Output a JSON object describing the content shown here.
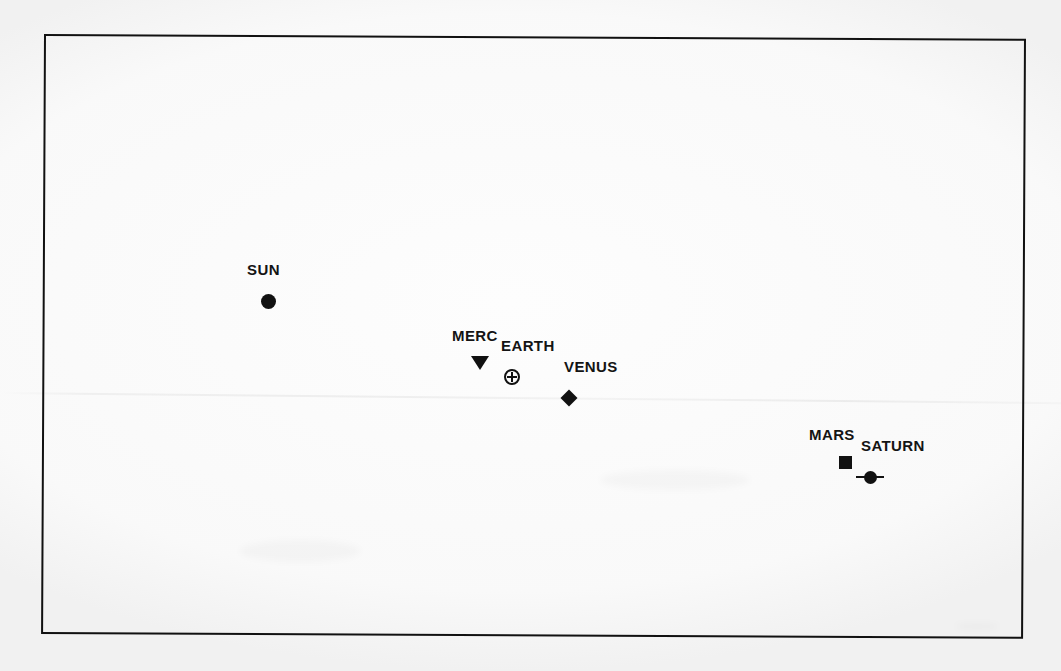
{
  "figure": {
    "type": "scatter",
    "background_color": "#fdfdfd",
    "ink_color": "#111111",
    "frame": {
      "name": "plot-border",
      "x": 44,
      "y": 34,
      "width": 982,
      "height": 600,
      "border_width": 2,
      "border_color": "#111111"
    }
  },
  "chart_data": {
    "type": "scatter",
    "title": "",
    "subtitle": "",
    "xlabel": "",
    "ylabel": "",
    "grid": false,
    "axis_ticks": false,
    "legend": "none",
    "xlim": [
      44,
      1026
    ],
    "ylim": [
      34,
      634
    ],
    "note": "Marker positions are given in page pixel coordinates; axes are unlabeled in the source figure.",
    "points": [
      {
        "label": "SUN",
        "marker": "filled-circle",
        "marker_size": 15,
        "x": 268,
        "y": 301,
        "label_x": 247,
        "label_y": 262
      },
      {
        "label": "MERC",
        "marker": "filled-triangle-down",
        "marker_size": 18,
        "x": 480,
        "y": 363,
        "label_x": 452,
        "label_y": 328
      },
      {
        "label": "EARTH",
        "marker": "circle-with-cross",
        "marker_size": 16,
        "x": 512,
        "y": 377,
        "label_x": 501,
        "label_y": 338
      },
      {
        "label": "VENUS",
        "marker": "filled-diamond",
        "marker_size": 16,
        "x": 569,
        "y": 398,
        "label_x": 564,
        "label_y": 359
      },
      {
        "label": "MARS",
        "marker": "filled-square",
        "marker_size": 13,
        "x": 845,
        "y": 462,
        "label_x": 809,
        "label_y": 427
      },
      {
        "label": "SATURN",
        "marker": "filled-circle-with-ring",
        "marker_size": 13,
        "x": 870,
        "y": 477,
        "label_x": 861,
        "label_y": 438
      }
    ]
  }
}
